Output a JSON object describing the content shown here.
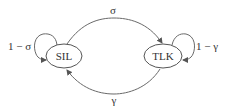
{
  "diagram": {
    "type": "state-transition",
    "nodes": [
      {
        "id": "SIL",
        "label": "SIL"
      },
      {
        "id": "TLK",
        "label": "TLK"
      }
    ],
    "edges": [
      {
        "from": "SIL",
        "to": "TLK",
        "label": "σ"
      },
      {
        "from": "TLK",
        "to": "SIL",
        "label": "γ"
      },
      {
        "from": "SIL",
        "to": "SIL",
        "label": "1 − σ"
      },
      {
        "from": "TLK",
        "to": "TLK",
        "label": "1 − γ"
      }
    ],
    "colors": {
      "stroke": "#6a6a6a",
      "text": "#333333",
      "background": "#ffffff"
    }
  }
}
